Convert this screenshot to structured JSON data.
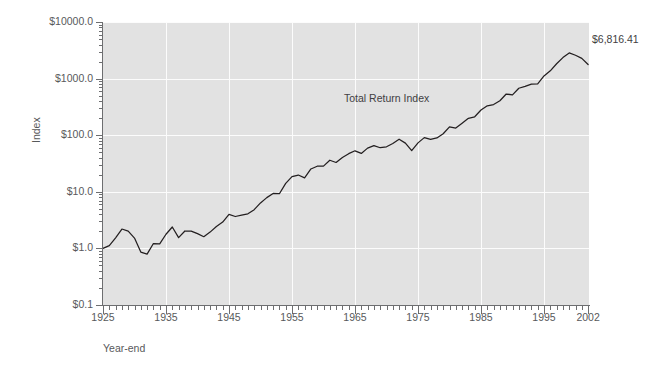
{
  "figure": {
    "background": "#ffffff",
    "plot_background": "#e2e2e2",
    "gridline_color": "#fcfcfc",
    "line_color": "#231f20",
    "axis_color": "#6d6e70"
  },
  "axes": {
    "y_title": "Index",
    "x_title": "Year-end",
    "y_ticks": [
      "$0.1",
      "$1.0",
      "$10.0",
      "$100.0",
      "$1000.0",
      "$10000.0"
    ],
    "x_ticks": [
      "1925",
      "1935",
      "1945",
      "1955",
      "1965",
      "1975",
      "1985",
      "1995",
      "2002"
    ]
  },
  "annotations": {
    "series_label": "Total Return Index",
    "endpoint_value": "$6,816.41"
  },
  "chart_data": {
    "type": "line",
    "title": "",
    "xlabel": "Year-end",
    "ylabel": "Index",
    "yscale": "log",
    "ylim": [
      0.1,
      10000
    ],
    "xlim": [
      1925,
      2002
    ],
    "grid": true,
    "legend": "none",
    "series": [
      {
        "name": "Total Return Index",
        "color": "#231f20",
        "x": [
          1925,
          1926,
          1927,
          1928,
          1929,
          1930,
          1931,
          1932,
          1933,
          1934,
          1935,
          1936,
          1937,
          1938,
          1939,
          1940,
          1941,
          1942,
          1943,
          1944,
          1945,
          1946,
          1947,
          1948,
          1949,
          1950,
          1951,
          1952,
          1953,
          1954,
          1955,
          1956,
          1957,
          1958,
          1959,
          1960,
          1961,
          1962,
          1963,
          1964,
          1965,
          1966,
          1967,
          1968,
          1969,
          1970,
          1971,
          1972,
          1973,
          1974,
          1975,
          1976,
          1977,
          1978,
          1979,
          1980,
          1981,
          1982,
          1983,
          1984,
          1985,
          1986,
          1987,
          1988,
          1989,
          1990,
          1991,
          1992,
          1993,
          1994,
          1995,
          1996,
          1997,
          1998,
          1999,
          2000,
          2001,
          2002
        ],
        "y": [
          1.0,
          1.12,
          1.54,
          2.2,
          2.02,
          1.52,
          0.86,
          0.79,
          1.22,
          1.2,
          1.78,
          2.39,
          1.55,
          2.03,
          2.02,
          1.82,
          1.61,
          1.94,
          2.44,
          2.92,
          3.98,
          3.66,
          3.87,
          4.08,
          4.83,
          6.36,
          7.89,
          9.34,
          9.25,
          14.11,
          18.56,
          19.78,
          17.65,
          25.3,
          28.32,
          28.45,
          36.1,
          32.95,
          40.47,
          47.14,
          53.01,
          47.67,
          59.1,
          65.64,
          60.06,
          62.47,
          71.41,
          84.96,
          72.5,
          53.31,
          73.14,
          90.58,
          84.08,
          89.59,
          106.11,
          140.51,
          133.61,
          162.4,
          199.06,
          211.6,
          278.59,
          330.49,
          347.8,
          405.47,
          533.76,
          517.22,
          674.83,
          726.35,
          799.48,
          809.93,
          1113.92,
          1370.0,
          1828.33,
          2350.89,
          2845.63,
          2586.52,
          2279.44,
          1775.34
        ]
      }
    ]
  }
}
